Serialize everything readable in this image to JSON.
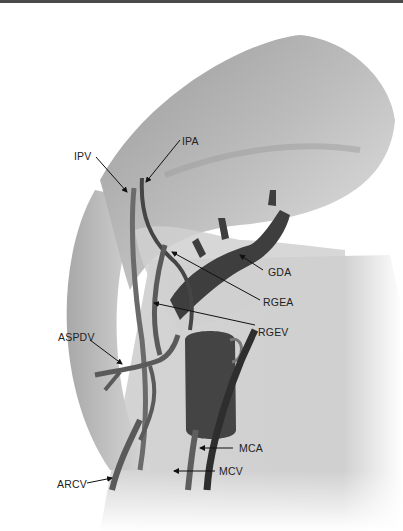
{
  "figure": {
    "type": "anatomical-illustration",
    "colors": {
      "background": "#ffffff",
      "top_rule": "#4a4a4a",
      "organ_light": "#c8c8c8",
      "organ_mid": "#a9a9a9",
      "colon": "#b4b4b4",
      "vessel_vein": "#6b6b6b",
      "vessel_artery": "#3e3e3e",
      "label_text": "#222222"
    }
  },
  "labels": {
    "ipv": "IPV",
    "ipa": "IPA",
    "gda": "GDA",
    "rgea": "RGEA",
    "rgev": "RGEV",
    "aspdv": "ASPDV",
    "mca": "MCA",
    "mcv": "MCV",
    "arcv": "ARCV"
  }
}
